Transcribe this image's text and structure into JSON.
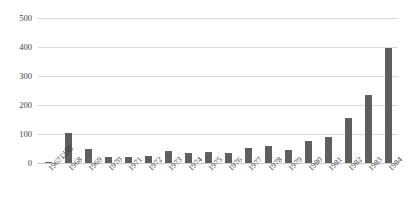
{
  "chart_data": {
    "type": "bar",
    "title": "",
    "subtitle": "",
    "xlabel": "",
    "ylabel": "",
    "ylim": [
      0,
      500
    ],
    "ytick_values": [
      500,
      400,
      300,
      200,
      100,
      0
    ],
    "ytick_labels": [
      "500",
      "400",
      "300",
      "200",
      "100",
      "0"
    ],
    "grid": true,
    "legend": false,
    "legend_position": "none",
    "bar_color": "#5f5f5f",
    "gridline_color": "#d9d9d9",
    "background_color": "#ffffff",
    "text_color": "#3f3f3f",
    "xtick_rotation": -45,
    "categories": [
      "1967以前",
      "1968",
      "1969",
      "1970",
      "1971",
      "1972",
      "1973",
      "1974",
      "1975",
      "1976",
      "1977",
      "1978",
      "1979",
      "1980",
      "1981",
      "1982",
      "1983",
      "1984"
    ],
    "values": [
      4,
      103,
      50,
      20,
      20,
      24,
      40,
      36,
      37,
      36,
      52,
      59,
      45,
      75,
      88,
      155,
      234,
      396
    ]
  }
}
